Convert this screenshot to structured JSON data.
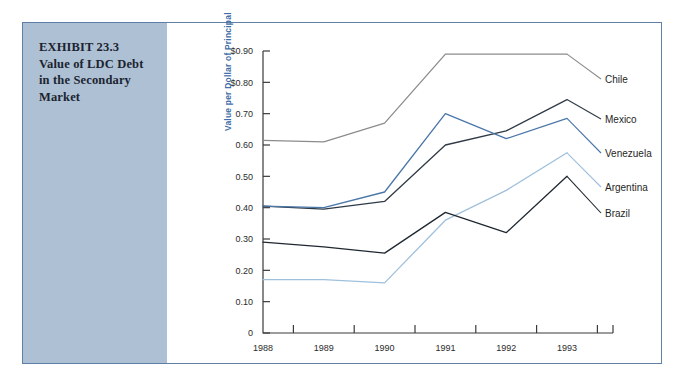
{
  "exhibit": {
    "caption_lines": [
      "EXHIBIT 23.3",
      "Value of LDC Debt",
      "in the Secondary",
      "Market"
    ],
    "panel_color": "#aec0d4",
    "border_color": "#5f7fa6"
  },
  "chart_data": {
    "type": "line",
    "title": "Value of LDC Debt in the Secondary Market",
    "xlabel": "",
    "ylabel": "Value per Dollar of Principal",
    "categories": [
      "1988",
      "1989",
      "1990",
      "1991",
      "1992",
      "1993"
    ],
    "x": [
      1988,
      1989,
      1990,
      1991,
      1992,
      1993
    ],
    "ylim": [
      0,
      0.9
    ],
    "ytick_labels": [
      "$0.90",
      "$0.80",
      "0.70",
      "0.60",
      "0.50",
      "0.40",
      "0.30",
      "0.20",
      "0.10",
      "0"
    ],
    "ytick_values": [
      0.9,
      0.8,
      0.7,
      0.6,
      0.5,
      0.4,
      0.3,
      0.2,
      0.1,
      0
    ],
    "grid": false,
    "legend_position": "right-inline-labels",
    "series": [
      {
        "name": "Chile",
        "values": [
          0.615,
          0.61,
          0.67,
          0.89,
          0.89,
          0.89
        ],
        "color": "#8c8c8c"
      },
      {
        "name": "Mexico",
        "values": [
          0.405,
          0.395,
          0.42,
          0.6,
          0.645,
          0.745
        ],
        "color": "#2f3a46"
      },
      {
        "name": "Venezuela",
        "values": [
          0.405,
          0.4,
          0.45,
          0.7,
          0.62,
          0.685
        ],
        "color": "#4a76a8"
      },
      {
        "name": "Argentina",
        "values": [
          0.17,
          0.17,
          0.16,
          0.36,
          0.455,
          0.575
        ],
        "color": "#9fc0dd"
      },
      {
        "name": "Brazil",
        "values": [
          0.29,
          0.275,
          0.255,
          0.385,
          0.32,
          0.5
        ],
        "color": "#1f2730"
      }
    ]
  },
  "axis_title_color": "#3f6ea8"
}
